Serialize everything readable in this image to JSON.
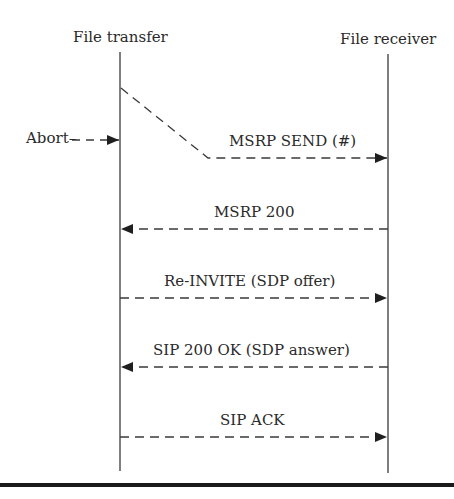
{
  "diagram": {
    "type": "sequence",
    "participants": [
      {
        "id": "sender",
        "label": "File transfer",
        "x": 120
      },
      {
        "id": "receiver",
        "label": "File receiver",
        "x": 388
      }
    ],
    "abort": {
      "label": "Abort",
      "y": 138
    },
    "messages": [
      {
        "label": "MSRP SEND (#)",
        "from": "sender",
        "to": "receiver",
        "y": 158,
        "style": "dashed"
      },
      {
        "label": "MSRP 200",
        "from": "receiver",
        "to": "sender",
        "y": 228,
        "style": "dashed"
      },
      {
        "label": "Re-INVITE (SDP offer)",
        "from": "sender",
        "to": "receiver",
        "y": 298,
        "style": "dashed"
      },
      {
        "label": "SIP 200 OK (SDP answer)",
        "from": "receiver",
        "to": "sender",
        "y": 367,
        "style": "dashed"
      },
      {
        "label": "SIP ACK",
        "from": "sender",
        "to": "receiver",
        "y": 437,
        "style": "dashed"
      }
    ],
    "colors": {
      "line": "#3a3a3a",
      "text": "#2a2a2a",
      "rule": "#1a1a1a"
    }
  }
}
